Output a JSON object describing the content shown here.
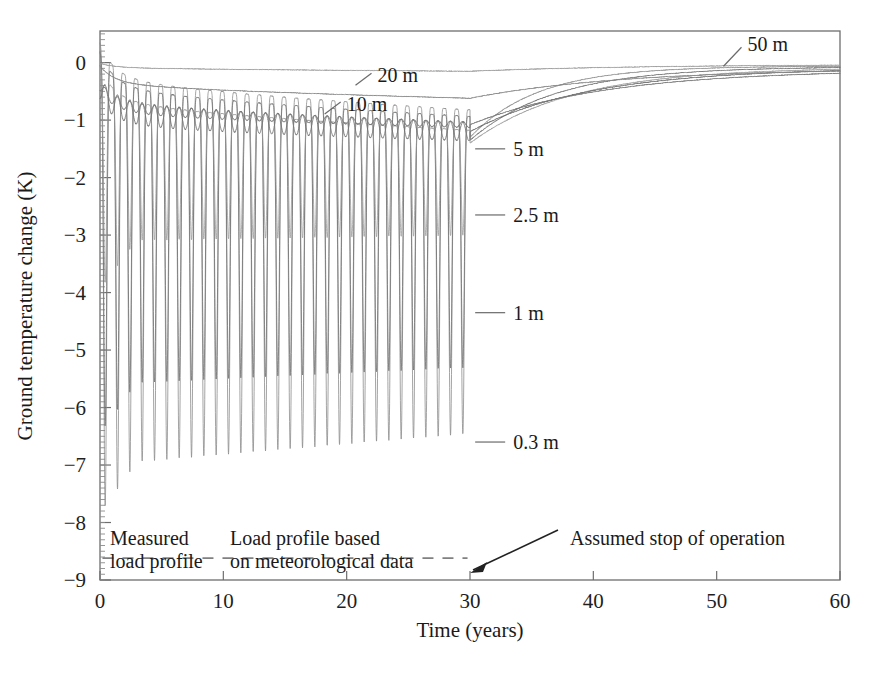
{
  "chart_data": {
    "type": "line",
    "title": "",
    "xlabel": "Time (years)",
    "ylabel": "Ground temperature change (K)",
    "xlim": [
      0,
      60
    ],
    "ylim": [
      -9,
      0.55
    ],
    "xticks": [
      0,
      10,
      20,
      30,
      40,
      50,
      60
    ],
    "xticklabels": [
      "0",
      "10",
      "20",
      "30",
      "40",
      "50",
      "60"
    ],
    "yticks": [
      0,
      -1,
      -2,
      -3,
      -4,
      -5,
      -6,
      -7,
      -8,
      -9
    ],
    "yticklabels": [
      "0",
      "-1",
      "-2",
      "-3",
      "-4",
      "-5",
      "-6",
      "-7",
      "-8",
      "-9"
    ],
    "grid": false,
    "legend_position": "inline-curve-labels",
    "operation_stop_year": 30,
    "series": [
      {
        "name": "0.3 m",
        "label": "0.3 m",
        "label_x": 33.5,
        "label_y": -6.6,
        "color": "#8a8a8a",
        "stroke_width": 0.85,
        "mean_start": -0.2,
        "mean_end": -1.3,
        "amp_start": 3.0,
        "amp_end": 2.65,
        "spike_low_start": -7.0,
        "spike_low_end": -6.45,
        "recovery_value": -0.06
      },
      {
        "name": "1 m",
        "label": "1 m",
        "label_x": 33.5,
        "label_y": -4.35,
        "color": "#6f6f6f",
        "stroke_width": 0.85,
        "mean_start": -0.25,
        "mean_end": -1.35,
        "amp_start": 2.4,
        "amp_end": 2.3,
        "spike_low_start": -5.6,
        "spike_low_end": -5.3,
        "recovery_value": -0.07
      },
      {
        "name": "2.5 m",
        "label": "2.5 m",
        "label_x": 33.5,
        "label_y": -2.65,
        "color": "#9a9a9a",
        "stroke_width": 0.85,
        "mean_start": -0.3,
        "mean_end": -1.4,
        "amp_start": 1.35,
        "amp_end": 1.25,
        "spike_low_start": -3.1,
        "spike_low_end": -3.0,
        "recovery_value": -0.08
      },
      {
        "name": "5 m",
        "label": "5 m",
        "label_x": 33.5,
        "label_y": -1.5,
        "color": "#707070",
        "stroke_width": 1.0,
        "mean_start": -0.45,
        "mean_end": -1.2,
        "amp_start": 0.2,
        "amp_end": 0.16,
        "recovery_value": -0.09
      },
      {
        "name": "10 m",
        "label": "10 m",
        "label_x": 20.0,
        "label_y": -0.72,
        "color": "#777777",
        "stroke_width": 1.0,
        "mean_start": -0.4,
        "mean_end": -1.08,
        "amp_start": 0.09,
        "amp_end": 0.05,
        "recovery_value": -0.12
      },
      {
        "name": "20 m",
        "label": "20 m",
        "label_x": 22.5,
        "label_y": -0.22,
        "color": "#888888",
        "stroke_width": 1.0,
        "mean_start": -0.05,
        "mean_end": -0.62,
        "amp_start": 0.0,
        "amp_end": 0.0,
        "recovery_value": -0.1
      },
      {
        "name": "50 m",
        "label": "50 m",
        "label_x": 52.5,
        "label_y": 0.32,
        "color": "#9c9c9c",
        "stroke_width": 1.0,
        "mean_start": -0.01,
        "mean_end": -0.15,
        "amp_start": 0.0,
        "amp_end": 0.0,
        "recovery_value": -0.03
      }
    ],
    "annotations": [
      {
        "name": "measured-load-profile",
        "line1": "Measured",
        "line2": "load profile",
        "x": 0.6,
        "y": -8.55
      },
      {
        "name": "meteorological-load-profile",
        "line1": "Load profile based",
        "line2": "on meteorological data",
        "x": 9.5,
        "y": -8.55
      },
      {
        "name": "assumed-stop-of-operation",
        "line1": "Assumed stop of operation",
        "x": 34.0,
        "y": -8.35
      }
    ],
    "load_profile_dashed_line": {
      "y": -8.62,
      "x_start": 0.2,
      "x_end": 29.8,
      "color": "#808080"
    }
  },
  "axis": {
    "x_title": "Time (years)",
    "y_title": "Ground temperature change (K)"
  },
  "labels": {
    "depth_0_3": "0.3 m",
    "depth_1": "1 m",
    "depth_2_5": "2.5 m",
    "depth_5": "5 m",
    "depth_10": "10 m",
    "depth_20": "20 m",
    "depth_50": "50 m"
  },
  "annotations_text": {
    "measured_line1": "Measured",
    "measured_line2": "load profile",
    "meteo_line1": "Load profile based",
    "meteo_line2": "on meteorological data",
    "stop_operation": "Assumed stop of operation"
  },
  "colors": {
    "frame": "#6e6e6e",
    "text": "#1a1a1a",
    "dashed": "#808080"
  }
}
